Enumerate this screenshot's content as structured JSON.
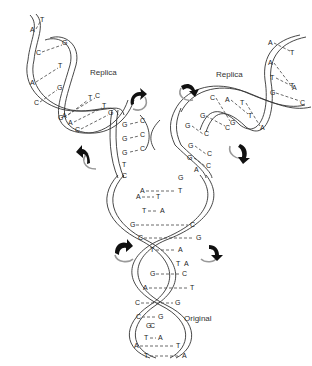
{
  "diagram": {
    "labels": {
      "replica_left": "Replica",
      "replica_right": "Replica",
      "original": "Original"
    },
    "colors": {
      "strand": "#333333",
      "arrow": "#111111",
      "arrow_shadow": "#999999",
      "background": "#ffffff"
    },
    "original_pairs": [
      {
        "l": "A",
        "r": "T"
      },
      {
        "l": "A",
        "r": "T"
      },
      {
        "l": "T",
        "r": "A"
      },
      {
        "l": "G",
        "r": "C"
      },
      {
        "l": "C",
        "r": "G"
      },
      {
        "l": "T",
        "r": "A"
      },
      {
        "l": "T",
        "r": "A"
      },
      {
        "l": "G",
        "r": "C"
      },
      {
        "l": "A",
        "r": "T"
      },
      {
        "l": "C",
        "r": "G"
      },
      {
        "l": "C",
        "r": "G"
      },
      {
        "l": "G",
        "r": "C"
      },
      {
        "l": "T",
        "r": "A"
      },
      {
        "l": "A",
        "r": "T"
      },
      {
        "l": "T",
        "r": "A"
      }
    ],
    "fork_left_bases": [
      "G",
      "G",
      "G",
      "T",
      "C"
    ],
    "fork_left_partners": [
      "C",
      "C",
      "C"
    ],
    "fork_right_bases": [
      "G",
      "G",
      "G",
      "A",
      "G"
    ],
    "fork_right_partners": [
      "C",
      "C",
      "C"
    ],
    "replica_left_pairs": [
      {
        "l": "A",
        "r": "T"
      },
      {
        "l": "C",
        "r": "G"
      },
      {
        "l": "A",
        "r": "T"
      },
      {
        "l": "C",
        "r": "G"
      },
      {
        "l": "G",
        "r": "C"
      },
      {
        "l": "A",
        "r": "T"
      },
      {
        "l": "C",
        "r": "G"
      },
      {
        "l": "A",
        "r": "T"
      }
    ],
    "replica_right_pairs": [
      {
        "l": "A",
        "r": "T"
      },
      {
        "l": "A",
        "r": "T"
      },
      {
        "l": "T",
        "r": "A"
      },
      {
        "l": "G",
        "r": "C"
      },
      {
        "l": "C",
        "r": "G"
      },
      {
        "l": "A",
        "r": "T"
      },
      {
        "l": "T",
        "r": "A"
      },
      {
        "l": "G",
        "r": "C"
      }
    ],
    "arrows": [
      {
        "name": "rotation-arrow-left-upper",
        "direction": "clockwise"
      },
      {
        "name": "rotation-arrow-left-lower",
        "direction": "counterclockwise"
      },
      {
        "name": "rotation-arrow-right-upper",
        "direction": "clockwise"
      },
      {
        "name": "rotation-arrow-right-lower",
        "direction": "counterclockwise"
      },
      {
        "name": "rotation-arrow-original-left",
        "direction": "clockwise"
      },
      {
        "name": "rotation-arrow-original-right",
        "direction": "counterclockwise"
      }
    ]
  }
}
